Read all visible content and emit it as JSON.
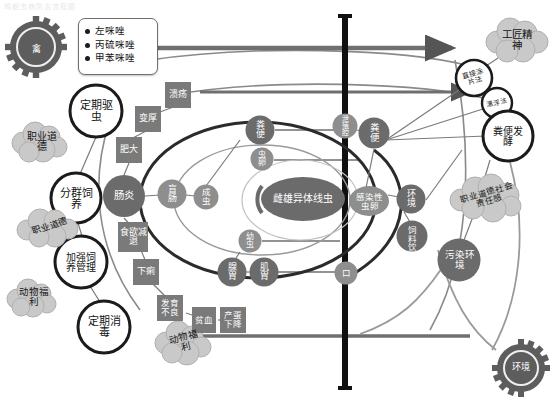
{
  "title": "鸡蛔虫病防治流程图",
  "colors": {
    "node_fill": "#6b6b6b",
    "node_fill_light": "#8e8e8e",
    "square_fill": "#7a7a7a",
    "cloud_fill": "#c9c9c9",
    "gear_fill": "#5d5d5d",
    "ring_stroke": "#1b1b1b",
    "line": "#6f6f6f",
    "thick_line": "#2b2b2b",
    "center_bar": "#111111",
    "legend_border": "#6f6f6f"
  },
  "legend": {
    "name": "drug-legend",
    "items": [
      "左咪唑",
      "丙硫咪唑",
      "甲苯咪唑"
    ]
  },
  "gears": [
    {
      "id": "gear-poultry",
      "label": "禽",
      "x": 36,
      "y": 47
    },
    {
      "id": "gear-environment",
      "label": "环境",
      "x": 521,
      "y": 368
    }
  ],
  "rings": [
    {
      "id": "ring-deworm",
      "label": "定期驱虫",
      "x": 96,
      "y": 111,
      "r": 26
    },
    {
      "id": "ring-group-rearing",
      "label": "分群饲养",
      "x": 76,
      "y": 198,
      "r": 25
    },
    {
      "id": "ring-feed-management",
      "label": "加强饲养管理",
      "x": 81,
      "y": 262,
      "r": 26
    },
    {
      "id": "ring-disinfection",
      "label": "定期消毒",
      "x": 104,
      "y": 327,
      "r": 26
    },
    {
      "id": "ring-smear-method",
      "label": "直接涂片法",
      "x": 474,
      "y": 78,
      "r": 18
    },
    {
      "id": "ring-flotation-method",
      "label": "漂浮法",
      "x": 497,
      "y": 103,
      "r": 15
    },
    {
      "id": "ring-feces-fermentation",
      "label": "粪便发酵",
      "x": 508,
      "y": 136,
      "r": 25
    }
  ],
  "clouds": [
    {
      "id": "cloud-professional-ethics-1",
      "label": "职业道德",
      "x": 41,
      "y": 141
    },
    {
      "id": "cloud-professional-ethics-2",
      "label": "职业道德",
      "x": 49,
      "y": 227
    },
    {
      "id": "cloud-animal-welfare-1",
      "label": "动物福利",
      "x": 33,
      "y": 297
    },
    {
      "id": "cloud-animal-welfare-2",
      "label": "动物福利",
      "x": 184,
      "y": 342
    },
    {
      "id": "cloud-craftsman-spirit",
      "label": "工匠精神",
      "x": 517,
      "y": 40
    },
    {
      "id": "cloud-ethics-responsibility",
      "label": "职业道德社会责任感",
      "x": 487,
      "y": 196
    }
  ],
  "squares": [
    {
      "id": "sq-ulcer",
      "label": "溃疡",
      "x": 178,
      "y": 95
    },
    {
      "id": "sq-thickening",
      "label": "变厚",
      "x": 148,
      "y": 119
    },
    {
      "id": "sq-hypertrophy",
      "label": "肥大",
      "x": 129,
      "y": 150
    },
    {
      "id": "sq-appetite-loss",
      "label": "食欲减退",
      "x": 133,
      "y": 237
    },
    {
      "id": "sq-diarrhea",
      "label": "下痢",
      "x": 146,
      "y": 272
    },
    {
      "id": "sq-poor-growth",
      "label": "发育不良",
      "x": 170,
      "y": 308
    },
    {
      "id": "sq-anemia",
      "label": "贫血",
      "x": 204,
      "y": 320
    },
    {
      "id": "sq-egg-drop",
      "label": "产蛋下降",
      "x": 233,
      "y": 320
    }
  ],
  "nodes": [
    {
      "id": "node-enteritis",
      "label": "肠炎",
      "x": 124,
      "y": 196,
      "rx": 21,
      "ry": 21
    },
    {
      "id": "node-cecum",
      "label": "盲肠",
      "x": 172,
      "y": 194,
      "rx": 14,
      "ry": 15
    },
    {
      "id": "node-adult-worm",
      "label": "成虫",
      "x": 206,
      "y": 197,
      "rx": 12,
      "ry": 13
    },
    {
      "id": "node-feces",
      "label": "粪便",
      "x": 260,
      "y": 130,
      "rx": 14,
      "ry": 15
    },
    {
      "id": "node-eggs",
      "label": "虫卵",
      "x": 262,
      "y": 159,
      "rx": 11,
      "ry": 12
    },
    {
      "id": "node-cloaca",
      "label": "泄殖腔",
      "x": 345,
      "y": 126,
      "rx": 12,
      "ry": 13
    },
    {
      "id": "node-dung",
      "label": "粪便",
      "x": 374,
      "y": 133,
      "rx": 15,
      "ry": 16
    },
    {
      "id": "node-nematode",
      "label": "雌雄异体线虫",
      "x": 303,
      "y": 199,
      "rx": 42,
      "ry": 22
    },
    {
      "id": "node-infective-egg",
      "label": "感染性虫卵",
      "x": 369,
      "y": 201,
      "rx": 20,
      "ry": 15
    },
    {
      "id": "node-environment",
      "label": "环境",
      "x": 411,
      "y": 199,
      "rx": 14,
      "ry": 15
    },
    {
      "id": "node-feed-water",
      "label": "饲料饮水",
      "x": 412,
      "y": 236,
      "rx": 15,
      "ry": 16
    },
    {
      "id": "node-larva",
      "label": "幼虫",
      "x": 250,
      "y": 241,
      "rx": 11,
      "ry": 12
    },
    {
      "id": "node-proventriculus",
      "label": "腺胃",
      "x": 232,
      "y": 272,
      "rx": 14,
      "ry": 15
    },
    {
      "id": "node-gizzard",
      "label": "肌胃",
      "x": 264,
      "y": 272,
      "rx": 14,
      "ry": 15
    },
    {
      "id": "node-mouth",
      "label": "口",
      "x": 346,
      "y": 273,
      "rx": 11,
      "ry": 12
    },
    {
      "id": "node-polluted-env",
      "label": "污染环境",
      "x": 459,
      "y": 260,
      "rx": 21,
      "ry": 22
    }
  ]
}
